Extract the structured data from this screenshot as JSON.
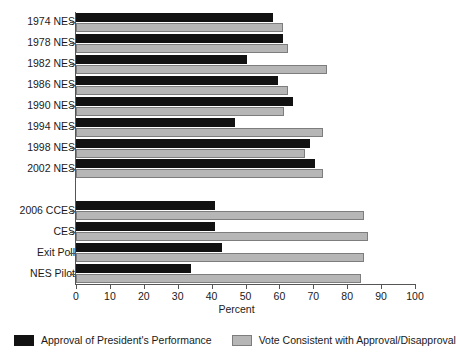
{
  "chart_data": {
    "type": "bar",
    "orientation": "horizontal",
    "title": "",
    "xlabel": "Percent",
    "ylabel": "",
    "xlim": [
      0,
      100
    ],
    "xticks": [
      0,
      10,
      20,
      30,
      40,
      50,
      60,
      70,
      80,
      90,
      100
    ],
    "grid": false,
    "legend_position": "bottom",
    "categories": [
      "1974 NES",
      "1978 NES",
      "1982 NES",
      "1986 NES",
      "1990 NES",
      "1994 NES",
      "1998 NES",
      "2002 NES",
      "",
      "2006 CCES",
      "CES",
      "Exit Poll",
      "NES Pilot"
    ],
    "series": [
      {
        "name": "Approval of President's Performance",
        "color": "#121212",
        "values": [
          58,
          61,
          50.5,
          59.5,
          64,
          47,
          69,
          70.5,
          null,
          41,
          41,
          43,
          34
        ]
      },
      {
        "name": "Vote Consistent with Approval/Disapproval",
        "color": "#b6b6b6",
        "values": [
          61,
          62.5,
          74,
          62.5,
          61.5,
          73,
          67.5,
          73,
          null,
          85,
          86,
          85,
          84
        ]
      }
    ]
  },
  "legend": {
    "items": [
      {
        "label": "Approval of President's Performance",
        "swatch": "approval"
      },
      {
        "label": "Vote Consistent with Approval/Disapproval",
        "swatch": "consistent"
      }
    ]
  }
}
